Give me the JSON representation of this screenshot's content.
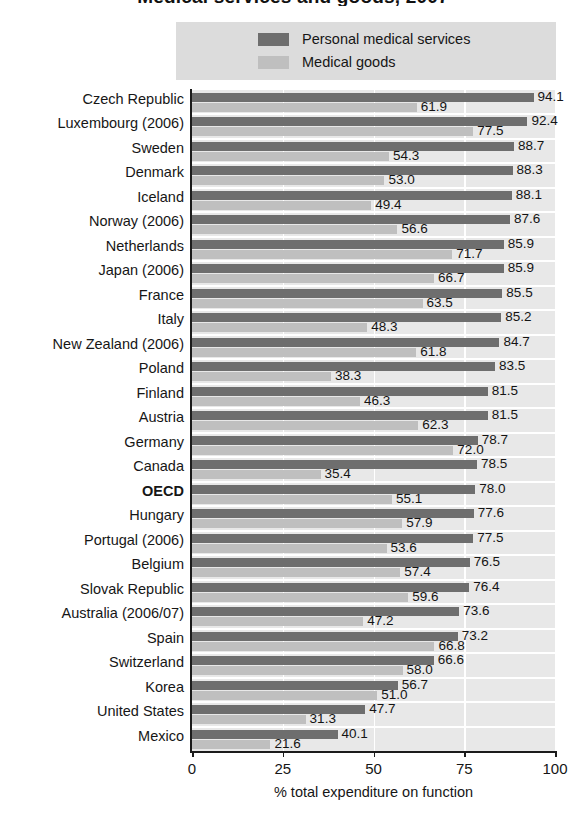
{
  "chart_data": {
    "type": "bar",
    "orientation": "horizontal",
    "title": "Medical services and goods, 2007",
    "xlabel": "% total expenditure on function",
    "ylabel": "",
    "xlim": [
      0,
      100
    ],
    "xticks": [
      0,
      25,
      50,
      75,
      100
    ],
    "xtick_labels": [
      "0",
      "25",
      "50",
      "75",
      "100"
    ],
    "grid": "vertical",
    "legend_position": "top",
    "categories": [
      "Czech Republic",
      "Luxembourg (2006)",
      "Sweden",
      "Denmark",
      "Iceland",
      "Norway (2006)",
      "Netherlands",
      "Japan (2006)",
      "France",
      "Italy",
      "New Zealand (2006)",
      "Poland",
      "Finland",
      "Austria",
      "Germany",
      "Canada",
      "OECD",
      "Hungary",
      "Portugal (2006)",
      "Belgium",
      "Slovak Republic",
      "Australia (2006/07)",
      "Spain",
      "Switzerland",
      "Korea",
      "United States",
      "Mexico"
    ],
    "highlight_category": "OECD",
    "series": [
      {
        "name": "Personal medical services",
        "color": "#6e6e6e",
        "values": [
          94.1,
          92.4,
          88.7,
          88.3,
          88.1,
          87.6,
          85.9,
          85.9,
          85.5,
          85.2,
          84.7,
          83.5,
          81.5,
          81.5,
          78.7,
          78.5,
          78.0,
          77.6,
          77.5,
          76.5,
          76.4,
          73.6,
          73.2,
          66.6,
          56.7,
          47.7,
          40.1
        ],
        "labels": [
          "94.1",
          "92.4",
          "88.7",
          "88.3",
          "88.1",
          "87.6",
          "85.9",
          "85.9",
          "85.5",
          "85.2",
          "84.7",
          "83.5",
          "81.5",
          "81.5",
          "78.7",
          "78.5",
          "78.0",
          "77.6",
          "77.5",
          "76.5",
          "76.4",
          "73.6",
          "73.2",
          "66.6",
          "56.7",
          "47.7",
          "40.1"
        ]
      },
      {
        "name": "Medical goods",
        "color": "#bfbfbf",
        "values": [
          61.9,
          77.5,
          54.3,
          53.0,
          49.4,
          56.6,
          71.7,
          66.7,
          63.5,
          48.3,
          61.8,
          38.3,
          46.3,
          62.3,
          72.0,
          35.4,
          55.1,
          57.9,
          53.6,
          57.4,
          59.6,
          47.2,
          66.8,
          58.0,
          51.0,
          31.3,
          21.6
        ],
        "labels": [
          "61.9",
          "77.5",
          "54.3",
          "53.0",
          "49.4",
          "56.6",
          "71.7",
          "66.7",
          "63.5",
          "48.3",
          "61.8",
          "38.3",
          "46.3",
          "62.3",
          "72.0",
          "35.4",
          "55.1",
          "57.9",
          "53.6",
          "57.4",
          "59.6",
          "47.2",
          "66.8",
          "58.0",
          "51.0",
          "31.3",
          "21.6"
        ]
      }
    ]
  },
  "legend": {
    "items": [
      {
        "label": "Personal medical services",
        "color": "#6e6e6e"
      },
      {
        "label": "Medical goods",
        "color": "#bfbfbf"
      }
    ]
  },
  "colors": {
    "plot_background": "#e8e8e8",
    "legend_background": "#dcdcdc",
    "axis": "#1b1b1b",
    "gridline": "#ffffff",
    "series_dark": "#6e6e6e",
    "series_light": "#bfbfbf"
  }
}
